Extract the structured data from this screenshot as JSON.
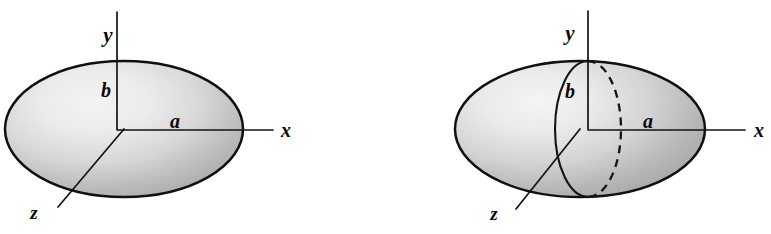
{
  "figure": {
    "background_color": "#ffffff",
    "ink_color": "#111111",
    "surface_light": "#f4f4f4",
    "surface_mid": "#cfcfcf",
    "surface_dark": "#9e9e9e",
    "panels": [
      {
        "id": "left-panel",
        "name": "elliptical-disk",
        "caption": "",
        "shape": "ellipse-disk",
        "center": [
          124,
          129
        ],
        "radius_x": 119,
        "radius_y": 68,
        "axes": [
          {
            "name": "y",
            "label": "y",
            "direction": "up",
            "tip": [
              117,
              12
            ]
          },
          {
            "name": "x",
            "label": "x",
            "direction": "right",
            "tip": [
              273,
              130
            ]
          },
          {
            "name": "z",
            "label": "z",
            "direction": "down-left",
            "tip": [
              58,
              207
            ]
          }
        ],
        "labels": [
          {
            "name": "y-axis-label",
            "text": "y",
            "x": 108,
            "y": 42
          },
          {
            "name": "semi-axis-b",
            "text": "b",
            "x": 106,
            "y": 97
          },
          {
            "name": "semi-axis-a",
            "text": "a",
            "x": 175,
            "y": 128
          },
          {
            "name": "z-axis-label",
            "text": "z",
            "x": 34,
            "y": 219
          },
          {
            "name": "x-axis-label",
            "text": "x",
            "x": 281,
            "y": 137
          }
        ]
      },
      {
        "id": "right-panel",
        "name": "ellipsoid-of-revolution",
        "caption": "",
        "shape": "ellipsoid-with-cross-section",
        "center": [
          580,
          129
        ],
        "radius_x": 125,
        "radius_y": 68,
        "cross_section": {
          "name": "vertical-meridian-circle",
          "center": [
            588,
            129
          ],
          "radius_x": 33,
          "radius_y": 68,
          "front_half": "solid",
          "back_half": "dashed"
        },
        "axes": [
          {
            "name": "y",
            "label": "y",
            "direction": "up",
            "tip": [
              588,
              11
            ]
          },
          {
            "name": "x",
            "label": "x",
            "direction": "right",
            "tip": [
              745,
              130
            ]
          },
          {
            "name": "z",
            "label": "z",
            "direction": "down-left",
            "tip": [
              516,
              209
            ]
          }
        ],
        "labels": [
          {
            "name": "y-axis-label",
            "text": "y",
            "x": 570,
            "y": 40
          },
          {
            "name": "semi-axis-b",
            "text": "b",
            "x": 570,
            "y": 98
          },
          {
            "name": "semi-axis-a",
            "text": "a",
            "x": 648,
            "y": 128
          },
          {
            "name": "z-axis-label",
            "text": "z",
            "x": 494,
            "y": 220
          },
          {
            "name": "x-axis-label",
            "text": "x",
            "x": 754,
            "y": 137
          }
        ]
      }
    ]
  }
}
